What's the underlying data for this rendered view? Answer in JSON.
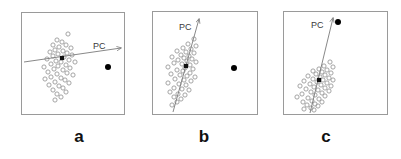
{
  "figure": {
    "background_color": "#ffffff",
    "width": 401,
    "height": 159
  },
  "style": {
    "box_stroke": "#9a9a9a",
    "circle_stroke": "#9a9a9a",
    "pc_line_color": "#7a7a7a",
    "outlier_color": "#000000",
    "centroid_color": "#111111",
    "label_color": "#111111",
    "pc_label_color": "#3a3a3a",
    "circle_radius": 2.1,
    "outlier_radius": 3.0,
    "centroid_size": 4.2
  },
  "panels": [
    {
      "id": "panel-a",
      "letter": "a",
      "pc_label": "PC",
      "box": {
        "x": 21,
        "y": 12,
        "w": 104,
        "h": 103
      },
      "pc_line": {
        "x1": 24,
        "y1": 62,
        "x2": 121,
        "y2": 48
      },
      "pc_label_pos": {
        "x": 93,
        "y": 42
      },
      "centroid": {
        "x": 62,
        "y": 58
      },
      "outlier": {
        "x": 108,
        "y": 67
      },
      "points": [
        {
          "x": 68,
          "y": 34
        },
        {
          "x": 57,
          "y": 40
        },
        {
          "x": 62,
          "y": 42
        },
        {
          "x": 53,
          "y": 45
        },
        {
          "x": 66,
          "y": 45
        },
        {
          "x": 59,
          "y": 47
        },
        {
          "x": 71,
          "y": 48
        },
        {
          "x": 55,
          "y": 50
        },
        {
          "x": 63,
          "y": 51
        },
        {
          "x": 50,
          "y": 52
        },
        {
          "x": 67,
          "y": 53
        },
        {
          "x": 58,
          "y": 54
        },
        {
          "x": 72,
          "y": 55
        },
        {
          "x": 53,
          "y": 56
        },
        {
          "x": 64,
          "y": 57
        },
        {
          "x": 47,
          "y": 59
        },
        {
          "x": 69,
          "y": 60
        },
        {
          "x": 56,
          "y": 61
        },
        {
          "x": 61,
          "y": 62
        },
        {
          "x": 75,
          "y": 62
        },
        {
          "x": 51,
          "y": 64
        },
        {
          "x": 66,
          "y": 65
        },
        {
          "x": 58,
          "y": 66
        },
        {
          "x": 44,
          "y": 67
        },
        {
          "x": 70,
          "y": 68
        },
        {
          "x": 54,
          "y": 69
        },
        {
          "x": 63,
          "y": 70
        },
        {
          "x": 48,
          "y": 72
        },
        {
          "x": 67,
          "y": 73
        },
        {
          "x": 57,
          "y": 74
        },
        {
          "x": 73,
          "y": 75
        },
        {
          "x": 51,
          "y": 77
        },
        {
          "x": 61,
          "y": 78
        },
        {
          "x": 45,
          "y": 79
        },
        {
          "x": 65,
          "y": 80
        },
        {
          "x": 55,
          "y": 82
        },
        {
          "x": 69,
          "y": 83
        },
        {
          "x": 49,
          "y": 85
        },
        {
          "x": 59,
          "y": 86
        },
        {
          "x": 63,
          "y": 88
        },
        {
          "x": 53,
          "y": 90
        },
        {
          "x": 66,
          "y": 92
        },
        {
          "x": 57,
          "y": 94
        },
        {
          "x": 61,
          "y": 97
        },
        {
          "x": 55,
          "y": 100
        }
      ]
    },
    {
      "id": "panel-b",
      "letter": "b",
      "pc_label": "PC",
      "box": {
        "x": 152,
        "y": 11,
        "w": 106,
        "h": 104
      },
      "pc_line": {
        "x1": 173,
        "y1": 112,
        "x2": 199,
        "y2": 19
      },
      "pc_label_pos": {
        "x": 179,
        "y": 23
      },
      "centroid": {
        "x": 186,
        "y": 66
      },
      "outlier": {
        "x": 234,
        "y": 68
      },
      "points": [
        {
          "x": 194,
          "y": 39
        },
        {
          "x": 188,
          "y": 44
        },
        {
          "x": 196,
          "y": 46
        },
        {
          "x": 183,
          "y": 48
        },
        {
          "x": 191,
          "y": 49
        },
        {
          "x": 177,
          "y": 51
        },
        {
          "x": 186,
          "y": 52
        },
        {
          "x": 194,
          "y": 53
        },
        {
          "x": 181,
          "y": 55
        },
        {
          "x": 189,
          "y": 56
        },
        {
          "x": 172,
          "y": 57
        },
        {
          "x": 184,
          "y": 58
        },
        {
          "x": 192,
          "y": 59
        },
        {
          "x": 178,
          "y": 60
        },
        {
          "x": 187,
          "y": 61
        },
        {
          "x": 196,
          "y": 62
        },
        {
          "x": 174,
          "y": 63
        },
        {
          "x": 182,
          "y": 64
        },
        {
          "x": 190,
          "y": 65
        },
        {
          "x": 168,
          "y": 67
        },
        {
          "x": 185,
          "y": 68
        },
        {
          "x": 193,
          "y": 69
        },
        {
          "x": 177,
          "y": 70
        },
        {
          "x": 183,
          "y": 71
        },
        {
          "x": 190,
          "y": 73
        },
        {
          "x": 171,
          "y": 74
        },
        {
          "x": 180,
          "y": 75
        },
        {
          "x": 187,
          "y": 76
        },
        {
          "x": 195,
          "y": 77
        },
        {
          "x": 175,
          "y": 79
        },
        {
          "x": 184,
          "y": 80
        },
        {
          "x": 191,
          "y": 81
        },
        {
          "x": 168,
          "y": 83
        },
        {
          "x": 179,
          "y": 84
        },
        {
          "x": 186,
          "y": 85
        },
        {
          "x": 174,
          "y": 88
        },
        {
          "x": 182,
          "y": 89
        },
        {
          "x": 189,
          "y": 90
        },
        {
          "x": 170,
          "y": 92
        },
        {
          "x": 178,
          "y": 94
        },
        {
          "x": 185,
          "y": 95
        },
        {
          "x": 174,
          "y": 97
        },
        {
          "x": 181,
          "y": 99
        },
        {
          "x": 177,
          "y": 102
        },
        {
          "x": 172,
          "y": 105
        }
      ]
    },
    {
      "id": "panel-c",
      "letter": "c",
      "pc_label": "PC",
      "box": {
        "x": 283,
        "y": 11,
        "w": 105,
        "h": 104
      },
      "pc_line": {
        "x1": 310,
        "y1": 113,
        "x2": 333,
        "y2": 18
      },
      "pc_label_pos": {
        "x": 311,
        "y": 21
      },
      "centroid": {
        "x": 319,
        "y": 80
      },
      "outlier": {
        "x": 338,
        "y": 22
      },
      "points": [
        {
          "x": 330,
          "y": 62
        },
        {
          "x": 324,
          "y": 66
        },
        {
          "x": 333,
          "y": 67
        },
        {
          "x": 319,
          "y": 69
        },
        {
          "x": 327,
          "y": 70
        },
        {
          "x": 313,
          "y": 71
        },
        {
          "x": 322,
          "y": 72
        },
        {
          "x": 331,
          "y": 73
        },
        {
          "x": 316,
          "y": 74
        },
        {
          "x": 325,
          "y": 75
        },
        {
          "x": 308,
          "y": 76
        },
        {
          "x": 320,
          "y": 77
        },
        {
          "x": 329,
          "y": 78
        },
        {
          "x": 313,
          "y": 79
        },
        {
          "x": 323,
          "y": 80
        },
        {
          "x": 333,
          "y": 80
        },
        {
          "x": 304,
          "y": 81
        },
        {
          "x": 317,
          "y": 82
        },
        {
          "x": 327,
          "y": 83
        },
        {
          "x": 310,
          "y": 84
        },
        {
          "x": 321,
          "y": 85
        },
        {
          "x": 331,
          "y": 86
        },
        {
          "x": 300,
          "y": 86
        },
        {
          "x": 314,
          "y": 87
        },
        {
          "x": 325,
          "y": 88
        },
        {
          "x": 306,
          "y": 89
        },
        {
          "x": 318,
          "y": 90
        },
        {
          "x": 329,
          "y": 91
        },
        {
          "x": 311,
          "y": 92
        },
        {
          "x": 322,
          "y": 93
        },
        {
          "x": 302,
          "y": 94
        },
        {
          "x": 315,
          "y": 95
        },
        {
          "x": 325,
          "y": 96
        },
        {
          "x": 297,
          "y": 97
        },
        {
          "x": 308,
          "y": 98
        },
        {
          "x": 319,
          "y": 99
        },
        {
          "x": 312,
          "y": 101
        },
        {
          "x": 303,
          "y": 102
        },
        {
          "x": 322,
          "y": 102
        },
        {
          "x": 315,
          "y": 104
        },
        {
          "x": 307,
          "y": 105
        },
        {
          "x": 318,
          "y": 106
        },
        {
          "x": 311,
          "y": 108
        },
        {
          "x": 304,
          "y": 109
        },
        {
          "x": 314,
          "y": 110
        }
      ]
    }
  ],
  "panel_labels": [
    {
      "letter": "a",
      "x": 64,
      "y": 128
    },
    {
      "letter": "b",
      "x": 189,
      "y": 128
    },
    {
      "letter": "c",
      "x": 311,
      "y": 128
    }
  ]
}
